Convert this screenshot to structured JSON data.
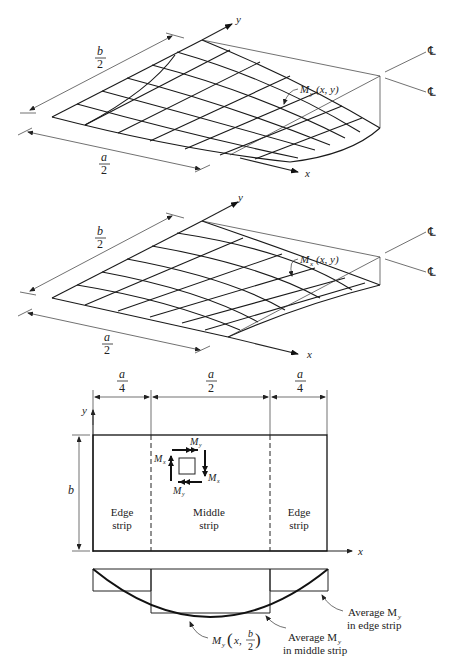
{
  "figure_top": {
    "axis_x": "x",
    "axis_y": "y",
    "dim_b_num": "b",
    "dim_b_den": "2",
    "dim_a_num": "a",
    "dim_a_den": "2",
    "surface_label": "M",
    "surface_sub": "y",
    "surface_args": "(x, y)",
    "centerline_1": "℄",
    "centerline_2": "℄"
  },
  "figure_middle": {
    "axis_x": "x",
    "axis_y": "y",
    "dim_b_num": "b",
    "dim_b_den": "2",
    "dim_a_num": "a",
    "dim_a_den": "2",
    "surface_label": "M",
    "surface_sub": "x",
    "surface_args": "(x, y)",
    "centerline_1": "℄",
    "centerline_2": "℄"
  },
  "figure_plan": {
    "dims": [
      {
        "num": "a",
        "den": "4"
      },
      {
        "num": "a",
        "den": "2"
      },
      {
        "num": "a",
        "den": "4"
      }
    ],
    "axis_x": "x",
    "axis_y": "y",
    "dim_b": "b",
    "strips": [
      {
        "line1": "Edge",
        "line2": "strip"
      },
      {
        "line1": "Middle",
        "line2": "strip"
      },
      {
        "line1": "Edge",
        "line2": "strip"
      }
    ],
    "element_labels": {
      "my_top": "M",
      "my_top_sub": "y",
      "mx_left": "M",
      "mx_left_sub": "x",
      "mx_right": "M",
      "mx_right_sub": "x",
      "my_bottom": "M",
      "my_bottom_sub": "y"
    }
  },
  "figure_moment": {
    "curve_label_M": "M",
    "curve_label_sub": "y",
    "curve_label_x": "x,",
    "curve_label_num": "b",
    "curve_label_den": "2",
    "avg_middle_line1": "Average M",
    "avg_middle_sub": "y",
    "avg_middle_line2": "in middle strip",
    "avg_edge_line1": "Average M",
    "avg_edge_sub": "y",
    "avg_edge_line2": "in edge strip"
  }
}
